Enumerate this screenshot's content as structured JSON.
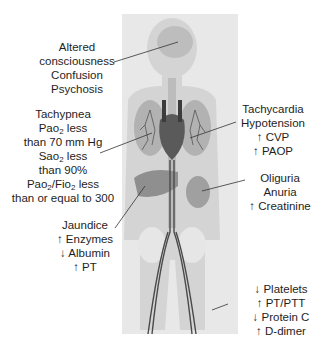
{
  "figure": {
    "panel_color": "#e8e8e8",
    "body_color": "#cfcfcf",
    "organ_color": "#9a9a9a",
    "vessel_color": "#4a4a4a"
  },
  "labels": {
    "brain": {
      "lines": [
        "Altered",
        "consciousness",
        "Confusion",
        "Psychosis"
      ]
    },
    "lungs": {
      "lines": [
        "Tachypnea",
        "Pao2 less",
        "than 70 mm Hg",
        "Sao2 less",
        "than 90%",
        "Pao2/Fio2 less",
        "than or equal to 300"
      ]
    },
    "heart": {
      "lines": [
        "Tachycardia",
        "Hypotension",
        "↑ CVP",
        "↑ PAOP"
      ]
    },
    "kidney": {
      "lines": [
        "Oliguria",
        "Anuria",
        "↑ Creatinine"
      ]
    },
    "liver": {
      "lines": [
        "Jaundice",
        "↑ Enzymes",
        "↓ Albumin",
        "↑ PT"
      ]
    },
    "blood": {
      "lines": [
        "↓ Platelets",
        "↑ PT/PTT",
        "↓ Protein C",
        "↑ D-dimer"
      ]
    }
  }
}
